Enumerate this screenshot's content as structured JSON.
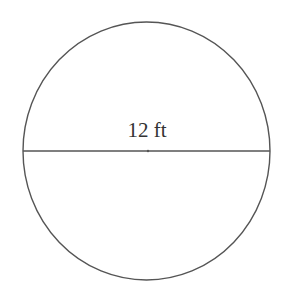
{
  "diagram": {
    "shape": "circle",
    "diameter_label": "12 ft",
    "stroke_color": "#555555",
    "text_color": "#333333",
    "background": "#ffffff"
  }
}
